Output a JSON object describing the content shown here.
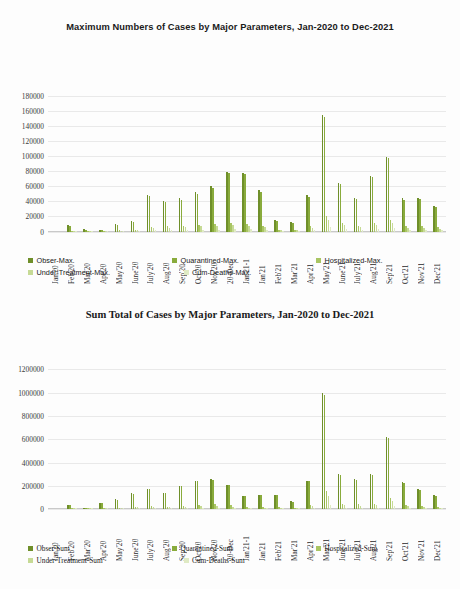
{
  "colors": {
    "series1": "#6f8f2a",
    "series2": "#89ab3c",
    "series3": "#a9c563",
    "series4": "#c6da95",
    "series5": "#dfeac4",
    "gridline": "#e9e9e9",
    "text": "#1a1a1a"
  },
  "chart_data": [
    {
      "type": "bar",
      "title": "Maximum Numbers of Cases by Major Parameters, Jan-2020 to Dec-2021",
      "xlabel": "",
      "ylabel": "",
      "ylim": [
        0,
        180000
      ],
      "yticks": [
        0,
        20000,
        40000,
        60000,
        80000,
        100000,
        120000,
        140000,
        160000,
        180000
      ],
      "ytick_labels": [
        "0",
        "20000",
        "40000",
        "60000",
        "80000",
        "100000",
        "120000",
        "140000",
        "160000",
        "180000"
      ],
      "grid": true,
      "legend_position": "bottom-left",
      "categories": [
        "Jan'20",
        "Feb'20",
        "Mar'20",
        "Apr'20",
        "May'20",
        "June'20",
        "July'20",
        "Aug'20",
        "Sep'20",
        "Oct'20",
        "Nov'20",
        "20-Dec",
        "Jan'21-1",
        "Jan'21",
        "Feb'21",
        "Mar'21",
        "Apr'21",
        "May'21",
        "June'21",
        "July'21",
        "Aug'21",
        "Sep'21",
        "Oct'21",
        "Nov'21",
        "Dec'21"
      ],
      "series": [
        {
          "name": "Obser-Max.",
          "color": "#6f8f2a",
          "values": [
            0,
            9000,
            3000,
            2500,
            9500,
            13500,
            49000,
            41000,
            44000,
            52000,
            60000,
            79000,
            78000,
            55000,
            15000,
            13000,
            48000,
            155000,
            65000,
            45000,
            74000,
            99000,
            44000,
            45000,
            34000
          ]
        },
        {
          "name": "Quarantined-Max.",
          "color": "#89ab3c",
          "values": [
            0,
            8000,
            2600,
            2100,
            8800,
            12500,
            47000,
            39000,
            42000,
            50000,
            58000,
            77000,
            76000,
            53000,
            14000,
            12000,
            46000,
            152000,
            63000,
            43000,
            72000,
            97000,
            42000,
            43000,
            33000
          ]
        },
        {
          "name": "Hospitalized-Max.",
          "color": "#a9c563",
          "values": [
            0,
            1200,
            600,
            500,
            1800,
            2600,
            6000,
            7000,
            8000,
            9000,
            9500,
            11000,
            10000,
            8000,
            2500,
            2200,
            7000,
            21000,
            11000,
            7500,
            12000,
            16000,
            7000,
            7000,
            5500
          ]
        },
        {
          "name": "Under-Treatment-Max.",
          "color": "#c6da95",
          "values": [
            0,
            900,
            400,
            350,
            1300,
            1900,
            4500,
            5200,
            6000,
            6800,
            7200,
            8500,
            7800,
            6000,
            1800,
            1600,
            5200,
            15000,
            8200,
            5500,
            9000,
            12000,
            5200,
            5200,
            4000
          ]
        },
        {
          "name": "Cum-Deaths-Max.",
          "color": "#dfeac4",
          "values": [
            0,
            300,
            150,
            120,
            500,
            700,
            1600,
            1900,
            2200,
            2500,
            2700,
            3200,
            2900,
            2200,
            700,
            600,
            1900,
            5500,
            3000,
            2000,
            3300,
            4400,
            1900,
            1900,
            1500
          ]
        }
      ]
    },
    {
      "type": "bar",
      "title": "Sum Total of Cases by Major Parameters, Jan-2020 to Dec-2021",
      "xlabel": "",
      "ylabel": "",
      "ylim": [
        0,
        1200000
      ],
      "yticks": [
        0,
        200000,
        400000,
        600000,
        800000,
        1000000,
        1200000
      ],
      "ytick_labels": [
        "0",
        "200000",
        "400000",
        "600000",
        "800000",
        "1000000",
        "1200000"
      ],
      "grid": true,
      "legend_position": "bottom-left",
      "categories": [
        "Jan'20",
        "Feb'20",
        "Mar'20",
        "Apr'20",
        "May'20",
        "June'20",
        "July'20",
        "Aug'20",
        "Sep'20",
        "Oct'20",
        "Nov'20",
        "20-Dec",
        "Jan'21-1",
        "Jan'21",
        "Feb'21",
        "Mar'21",
        "Apr'21",
        "May'21",
        "June'21",
        "July'21",
        "Aug'21",
        "Sep'21",
        "Oct'21",
        "Nov'21",
        "Dec'21"
      ],
      "series": [
        {
          "name": "Obser-Sum",
          "color": "#6f8f2a",
          "values": [
            0,
            40000,
            12000,
            55000,
            85000,
            135000,
            175000,
            140000,
            200000,
            245000,
            255000,
            210000,
            115000,
            125000,
            125000,
            70000,
            245000,
            1000000,
            300000,
            255000,
            300000,
            620000,
            235000,
            170000,
            120000
          ]
        },
        {
          "name": "Quarantined-Sum",
          "color": "#89ab3c",
          "values": [
            0,
            38000,
            11000,
            52000,
            82000,
            130000,
            170000,
            135000,
            195000,
            240000,
            250000,
            205000,
            110000,
            120000,
            120000,
            66000,
            240000,
            980000,
            290000,
            248000,
            292000,
            610000,
            228000,
            165000,
            115000
          ]
        },
        {
          "name": "Hospitalized-Sum",
          "color": "#a9c563",
          "values": [
            0,
            6000,
            2000,
            9000,
            14000,
            22000,
            28000,
            23000,
            32000,
            39000,
            41000,
            34000,
            19000,
            20000,
            20000,
            11000,
            39000,
            160000,
            48000,
            41000,
            48000,
            99000,
            38000,
            27000,
            19000
          ]
        },
        {
          "name": "Under-Treatment-Sum",
          "color": "#c6da95",
          "values": [
            0,
            4000,
            1400,
            6000,
            9500,
            15000,
            19000,
            16000,
            22000,
            27000,
            28000,
            23000,
            13000,
            14000,
            14000,
            8000,
            27000,
            110000,
            33000,
            28000,
            33000,
            68000,
            26000,
            19000,
            13000
          ]
        },
        {
          "name": "Cum-Deaths-Sum",
          "color": "#dfeac4",
          "values": [
            0,
            1400,
            500,
            2100,
            3300,
            5200,
            6800,
            5500,
            7800,
            9500,
            9900,
            8200,
            4500,
            4900,
            4900,
            2700,
            9500,
            39000,
            11500,
            9800,
            11500,
            24000,
            9100,
            6600,
            4600
          ]
        }
      ]
    }
  ]
}
